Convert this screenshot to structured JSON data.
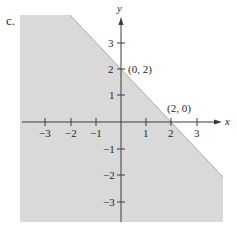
{
  "figure": {
    "part_label": "c.",
    "axes": {
      "x_label": "x",
      "y_label": "y",
      "x_ticks": [
        {
          "value": -3,
          "label": "−3"
        },
        {
          "value": -2,
          "label": "−2"
        },
        {
          "value": -1,
          "label": "−1"
        },
        {
          "value": 1,
          "label": "1"
        },
        {
          "value": 2,
          "label": "2"
        },
        {
          "value": 3,
          "label": "3"
        }
      ],
      "y_ticks": [
        {
          "value": 3,
          "label": "3"
        },
        {
          "value": 2,
          "label": "2"
        },
        {
          "value": 1,
          "label": "1"
        },
        {
          "value": -1,
          "label": "−1"
        },
        {
          "value": -2,
          "label": "−2"
        },
        {
          "value": -3,
          "label": "−3"
        }
      ]
    },
    "boundary_line": {
      "equation": "x + y = 2",
      "style": "solid"
    },
    "shaded_region": "x + y ≤ 2",
    "points": [
      {
        "label": "(0, 2)",
        "x": 0,
        "y": 2
      },
      {
        "label": "(2, 0)",
        "x": 2,
        "y": 0
      }
    ],
    "colors": {
      "shade": "#d9d9d9",
      "axis": "#3a3a3a",
      "boundary": "#8a8a8a"
    }
  }
}
